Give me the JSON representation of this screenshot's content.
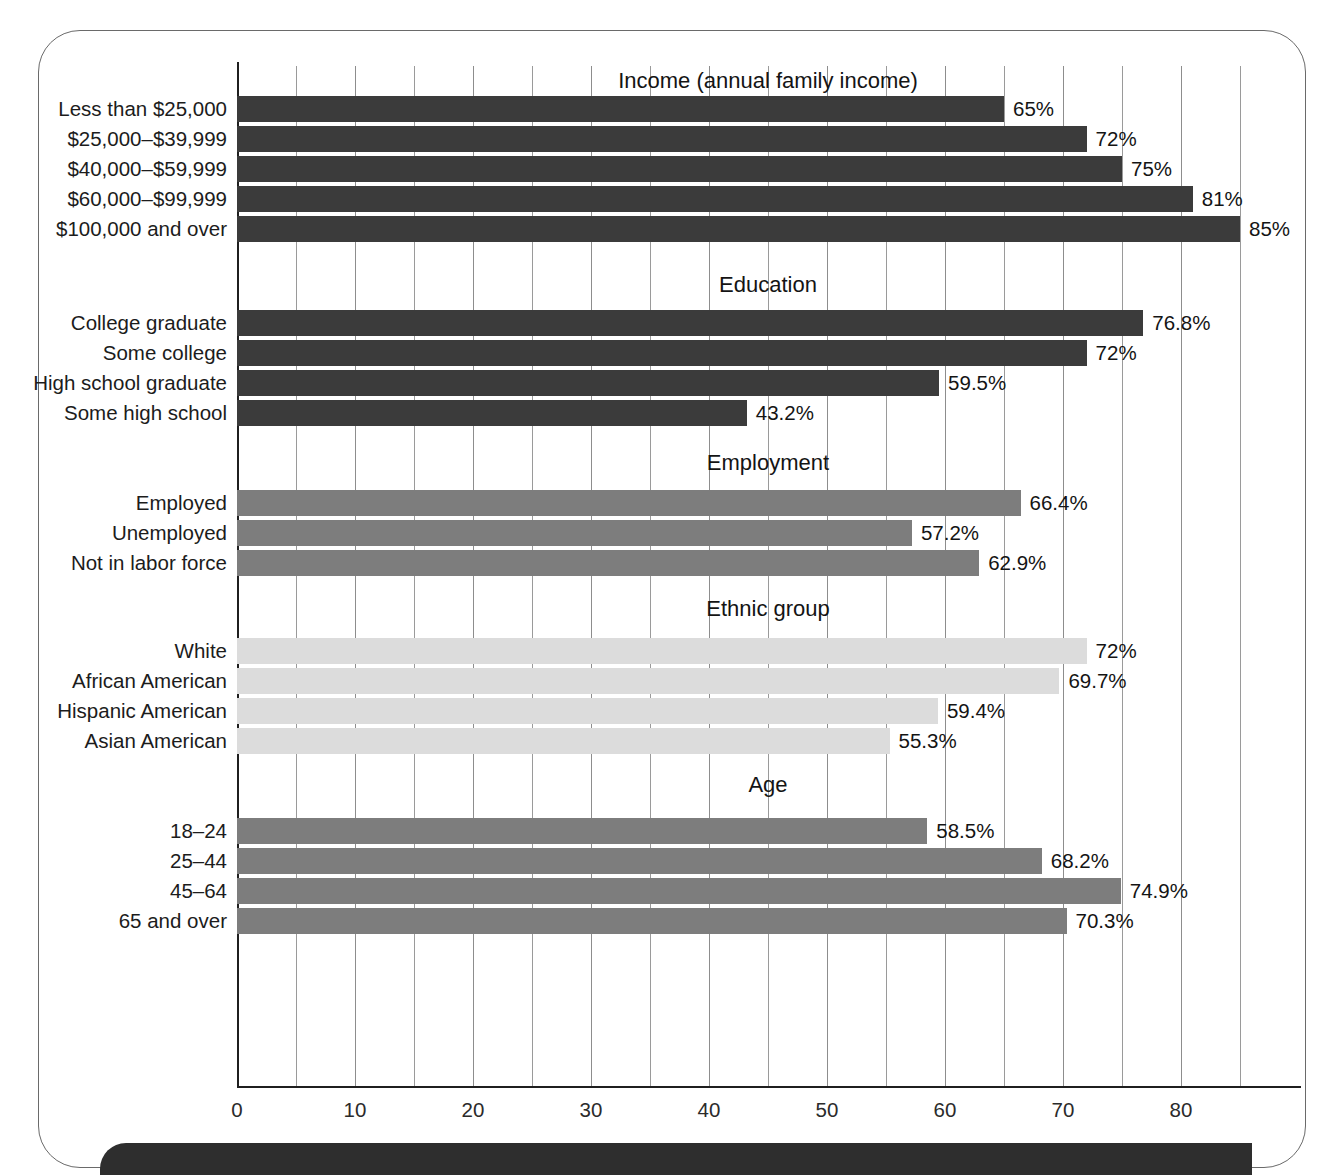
{
  "chart_data": {
    "type": "bar",
    "orientation": "horizontal",
    "title": "",
    "xlabel": "",
    "ylabel": "",
    "xlim": [
      0,
      87
    ],
    "xticks": [
      0,
      10,
      20,
      30,
      40,
      50,
      60,
      70,
      80
    ],
    "xtick_labels": [
      "0",
      "10",
      "20",
      "30",
      "40",
      "50",
      "60",
      "70",
      "80"
    ],
    "gridline_interval": 5,
    "grid": true,
    "legend": false,
    "value_suffix": "%",
    "colors": {
      "dark": "#3b3b3b",
      "mid": "#7d7d7d",
      "light": "#dcdcdc"
    },
    "groups": [
      {
        "title": "Income (annual family income)",
        "shade": "dark",
        "categories": [
          "Less than $25,000",
          "$25,000–$39,999",
          "$40,000–$59,999",
          "$60,000–$99,999",
          "$100,000 and over"
        ],
        "values": [
          65,
          72,
          75,
          81,
          85
        ],
        "labels": [
          "65%",
          "72%",
          "75%",
          "81%",
          "85%"
        ]
      },
      {
        "title": "Education",
        "shade": "dark",
        "categories": [
          "College graduate",
          "Some college",
          "High school graduate",
          "Some high school"
        ],
        "values": [
          76.8,
          72,
          59.5,
          43.2
        ],
        "labels": [
          "76.8%",
          "72%",
          "59.5%",
          "43.2%"
        ]
      },
      {
        "title": "Employment",
        "shade": "mid",
        "categories": [
          "Employed",
          "Unemployed",
          "Not in labor force"
        ],
        "values": [
          66.4,
          57.2,
          62.9
        ],
        "labels": [
          "66.4%",
          "57.2%",
          "62.9%"
        ]
      },
      {
        "title": "Ethnic group",
        "shade": "light",
        "categories": [
          "White",
          "African American",
          "Hispanic American",
          "Asian American"
        ],
        "values": [
          72,
          69.7,
          59.4,
          55.3
        ],
        "labels": [
          "72%",
          "69.7%",
          "59.4%",
          "55.3%"
        ]
      },
      {
        "title": "Age",
        "shade": "mid",
        "categories": [
          "18–24",
          "25–44",
          "45–64",
          "65 and over"
        ],
        "values": [
          58.5,
          68.2,
          74.9,
          70.3
        ],
        "labels": [
          "58.5%",
          "68.2%",
          "74.9%",
          "70.3%"
        ]
      }
    ]
  }
}
